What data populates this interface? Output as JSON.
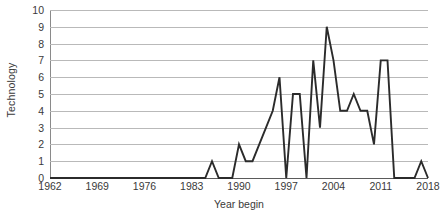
{
  "chart_data": {
    "type": "line",
    "title": "",
    "xlabel": "Year begin",
    "ylabel": "Technology",
    "xlim": [
      1962,
      2018
    ],
    "ylim": [
      0,
      10
    ],
    "grid": true,
    "legend": false,
    "legend_position": "none",
    "line_color": "#2b2b2b",
    "grid_color": "#b9b9b9",
    "y_ticks": [
      0,
      1,
      2,
      3,
      4,
      5,
      6,
      7,
      8,
      9,
      10
    ],
    "x_ticks": [
      1962,
      1969,
      1976,
      1983,
      1990,
      1997,
      2004,
      2011,
      2018
    ],
    "x": [
      1962,
      1963,
      1964,
      1965,
      1966,
      1967,
      1968,
      1969,
      1970,
      1971,
      1972,
      1973,
      1974,
      1975,
      1976,
      1977,
      1978,
      1979,
      1980,
      1981,
      1982,
      1983,
      1984,
      1985,
      1986,
      1987,
      1988,
      1989,
      1990,
      1991,
      1992,
      1993,
      1994,
      1995,
      1996,
      1997,
      1998,
      1999,
      2000,
      2001,
      2002,
      2003,
      2004,
      2005,
      2006,
      2007,
      2008,
      2009,
      2010,
      2011,
      2012,
      2013,
      2014,
      2015,
      2016,
      2017,
      2018
    ],
    "values": [
      0,
      0,
      0,
      0,
      0,
      0,
      0,
      0,
      0,
      0,
      0,
      0,
      0,
      0,
      0,
      0,
      0,
      0,
      0,
      0,
      0,
      0,
      0,
      0,
      1,
      0,
      0,
      0,
      2,
      1,
      1,
      2,
      3,
      4,
      6,
      0,
      5,
      5,
      0,
      7,
      3,
      9,
      7,
      4,
      4,
      5,
      4,
      4,
      2,
      7,
      7,
      0,
      0,
      0,
      0,
      1,
      0
    ],
    "series_name": "Technology"
  },
  "axis": {
    "y_title": "Technology",
    "x_title": "Year begin",
    "y_tick_labels": [
      "0",
      "1",
      "2",
      "3",
      "4",
      "5",
      "6",
      "7",
      "8",
      "9",
      "10"
    ],
    "x_tick_labels": [
      "1962",
      "1969",
      "1976",
      "1983",
      "1990",
      "1997",
      "2004",
      "2011",
      "2018"
    ]
  }
}
